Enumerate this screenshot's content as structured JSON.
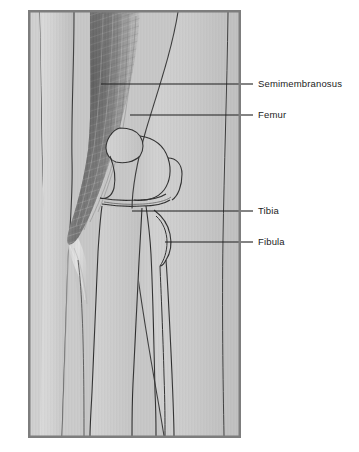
{
  "figure": {
    "frame": {
      "x": 28,
      "y": 10,
      "width": 213,
      "height": 428,
      "border_color": "#7a7a7a",
      "background_color": "#c9c9c9"
    },
    "palette": {
      "background_outer": "#ffffff",
      "panel_fill": "#c8c8c8",
      "skin_light": "#d6d6d6",
      "skin_mid": "#c2c2c2",
      "skin_shadow": "#a8a8a8",
      "muscle_dark": "#6f6f6f",
      "muscle_mid": "#9a9a9a",
      "muscle_light": "#d2d2d2",
      "bone_fill": "#cccccc",
      "outline": "#2e2e2e",
      "leader_line": "#222222",
      "text": "#1c1c1c"
    },
    "structures": [
      {
        "name": "semimembranosus",
        "kind": "muscle",
        "note": "striated fibers running diagonally down the posterior thigh"
      },
      {
        "name": "femur",
        "kind": "bone",
        "note": "thigh bone with condyle at the knee"
      },
      {
        "name": "tibia",
        "kind": "bone",
        "note": "shin bone, medial lower leg"
      },
      {
        "name": "fibula",
        "kind": "bone",
        "note": "slender lateral lower leg bone"
      },
      {
        "name": "patella",
        "kind": "bone",
        "note": "kneecap outline anterior to joint"
      },
      {
        "name": "joint-space",
        "kind": "space",
        "note": "meniscal/articular gap between femur and tibia"
      }
    ],
    "labels": [
      {
        "id": "semimembranosus",
        "text": "Semimembranosus",
        "text_x": 258,
        "text_y": 80,
        "leader": {
          "x1": 101,
          "y1": 84,
          "x2": 252,
          "y2": 84
        }
      },
      {
        "id": "femur",
        "text": "Femur",
        "text_x": 258,
        "text_y": 111,
        "leader": {
          "x1": 130,
          "y1": 115,
          "x2": 252,
          "y2": 115
        }
      },
      {
        "id": "tibia",
        "text": "Tibia",
        "text_x": 258,
        "text_y": 207,
        "leader": {
          "x1": 132,
          "y1": 211,
          "x2": 252,
          "y2": 211
        }
      },
      {
        "id": "fibula",
        "text": "Fibula",
        "text_x": 258,
        "text_y": 238,
        "leader": {
          "x1": 165,
          "y1": 242,
          "x2": 252,
          "y2": 242
        }
      }
    ]
  }
}
